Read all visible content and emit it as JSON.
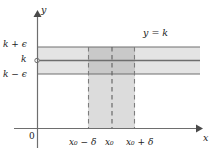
{
  "figure": {
    "colors": {
      "axis": "#6e6e6e",
      "line": "#6e6e6e",
      "horizontal_band_fill": "#e2e2e2",
      "vertical_band_fill": "#dcdcdc",
      "overlap_fill": "#c9c9c9",
      "dash": "#8a8a8a",
      "text": "#1a1a1a",
      "background": "#ffffff"
    },
    "labels": {
      "y_axis": "y",
      "x_axis": "x",
      "origin": "0",
      "k_plus_epsilon": "k + ϵ",
      "k": "k",
      "k_minus_epsilon": "k − ϵ",
      "function": "y = k",
      "x0_minus_delta": "x₀ − δ",
      "x0": "x₀",
      "x0_plus_delta": "x₀ + δ"
    },
    "label_parts": {
      "k_plus_epsilon": {
        "base": "k",
        "operator": "+",
        "term": "ϵ"
      },
      "k_minus_epsilon": {
        "base": "k",
        "operator": "−",
        "term": "ϵ"
      },
      "function_lhs": "y",
      "function_op": "=",
      "function_rhs": "k",
      "x0_base": "x",
      "x0_sub": "0",
      "delta": "δ",
      "minus": "−",
      "plus": "+"
    },
    "geometry": {
      "y_axis_x": 37,
      "x_axis_y": 128,
      "band_top_y": 47,
      "band_center_y": 60,
      "band_bottom_y": 74,
      "band_left_x": 37,
      "band_right_x": 200,
      "strip_left_x": 88,
      "strip_center_x": 112,
      "strip_right_x": 135,
      "strip_top_y": 47,
      "strip_bottom_y": 128
    }
  }
}
